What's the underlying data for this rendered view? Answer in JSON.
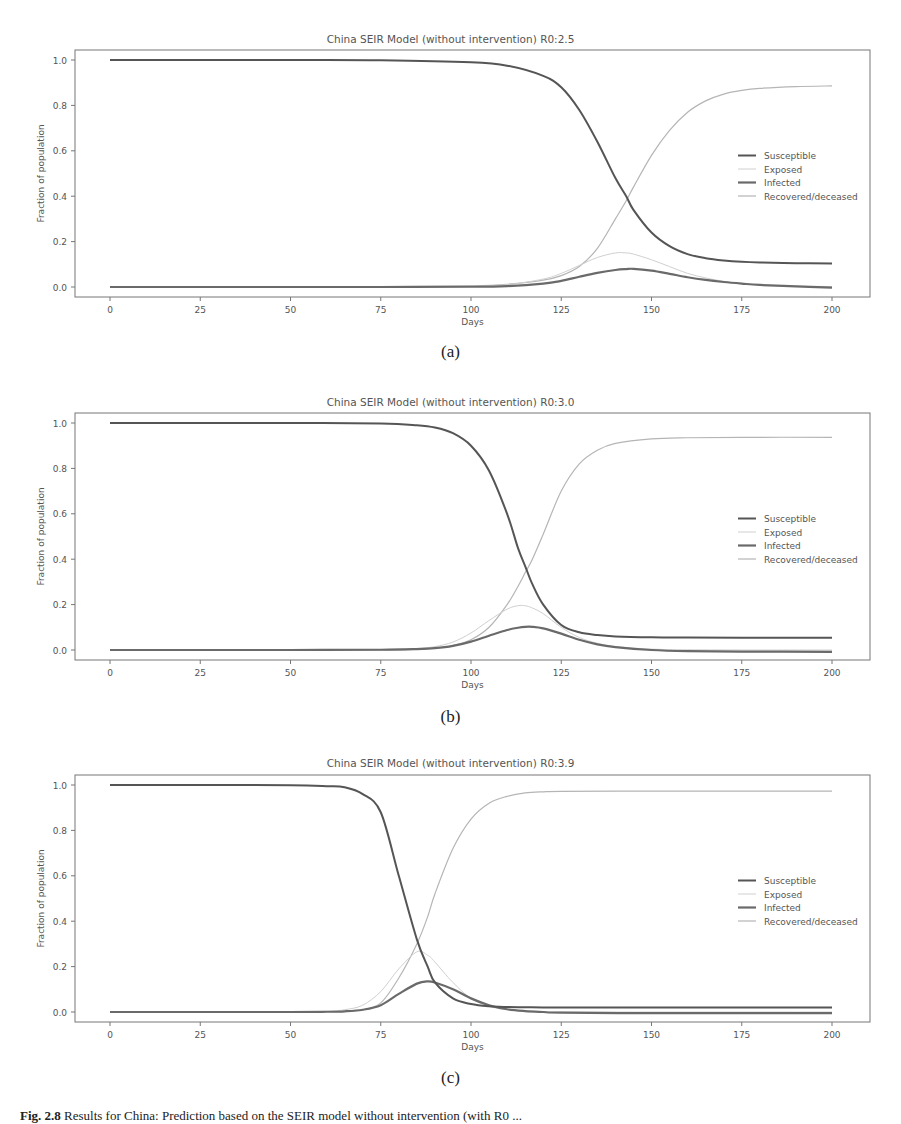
{
  "chart_data": [
    {
      "type": "line",
      "panel": "(a)",
      "title": "China SEIR Model (without intervention) R0:2.5",
      "xlabel": "Days",
      "ylabel": "Fraction of population",
      "xlim": [
        -8,
        208
      ],
      "ylim": [
        -0.05,
        1.05
      ],
      "xticks": [
        0,
        25,
        50,
        75,
        100,
        125,
        150,
        175,
        200
      ],
      "yticks": [
        0.0,
        0.2,
        0.4,
        0.6,
        0.8,
        1.0
      ],
      "grid": false,
      "legend_position": "center right",
      "x": [
        0,
        25,
        50,
        75,
        100,
        110,
        120,
        125,
        130,
        135,
        140,
        143,
        145,
        150,
        155,
        160,
        165,
        170,
        175,
        180,
        190,
        200
      ],
      "series": [
        {
          "name": "Susceptible",
          "color": "#555555",
          "values": [
            1.0,
            1.0,
            1.0,
            0.999,
            0.99,
            0.975,
            0.93,
            0.88,
            0.78,
            0.64,
            0.48,
            0.4,
            0.34,
            0.24,
            0.18,
            0.145,
            0.127,
            0.117,
            0.111,
            0.108,
            0.105,
            0.104
          ]
        },
        {
          "name": "Exposed",
          "color": "#d0d0d0",
          "values": [
            0.0,
            0.0,
            0.0,
            0.0,
            0.003,
            0.01,
            0.035,
            0.06,
            0.095,
            0.13,
            0.15,
            0.15,
            0.145,
            0.12,
            0.09,
            0.06,
            0.04,
            0.025,
            0.015,
            0.009,
            0.004,
            0.002
          ]
        },
        {
          "name": "Infected",
          "color": "#6a6a6a",
          "values": [
            0.0,
            0.0,
            0.0,
            0.0,
            0.001,
            0.004,
            0.015,
            0.027,
            0.045,
            0.062,
            0.075,
            0.079,
            0.08,
            0.072,
            0.058,
            0.043,
            0.031,
            0.022,
            0.015,
            0.009,
            0.003,
            -0.003
          ]
        },
        {
          "name": "Recovered/deceased",
          "color": "#b5b5b5",
          "values": [
            0.0,
            0.0,
            0.0,
            0.0,
            0.005,
            0.012,
            0.03,
            0.05,
            0.09,
            0.17,
            0.3,
            0.38,
            0.44,
            0.58,
            0.69,
            0.77,
            0.82,
            0.85,
            0.866,
            0.875,
            0.883,
            0.886
          ]
        }
      ]
    },
    {
      "type": "line",
      "panel": "(b)",
      "title": "China SEIR Model (without intervention) R0:3.0",
      "xlabel": "Days",
      "ylabel": "Fraction of population",
      "xlim": [
        -8,
        208
      ],
      "ylim": [
        -0.05,
        1.05
      ],
      "xticks": [
        0,
        25,
        50,
        75,
        100,
        125,
        150,
        175,
        200
      ],
      "yticks": [
        0.0,
        0.2,
        0.4,
        0.6,
        0.8,
        1.0
      ],
      "grid": false,
      "legend_position": "center right",
      "x": [
        0,
        25,
        50,
        75,
        85,
        90,
        95,
        100,
        105,
        110,
        113,
        115,
        117,
        120,
        125,
        130,
        135,
        140,
        150,
        160,
        175,
        200
      ],
      "series": [
        {
          "name": "Susceptible",
          "color": "#555555",
          "values": [
            1.0,
            1.0,
            1.0,
            0.998,
            0.99,
            0.98,
            0.955,
            0.9,
            0.79,
            0.6,
            0.45,
            0.37,
            0.29,
            0.2,
            0.11,
            0.078,
            0.066,
            0.06,
            0.056,
            0.055,
            0.054,
            0.054
          ]
        },
        {
          "name": "Exposed",
          "color": "#d0d0d0",
          "values": [
            0.0,
            0.0,
            0.0,
            0.002,
            0.007,
            0.015,
            0.035,
            0.075,
            0.13,
            0.18,
            0.195,
            0.195,
            0.185,
            0.16,
            0.1,
            0.055,
            0.03,
            0.015,
            0.004,
            0.001,
            0.0,
            0.0
          ]
        },
        {
          "name": "Infected",
          "color": "#6a6a6a",
          "values": [
            0.0,
            0.0,
            0.0,
            0.001,
            0.004,
            0.008,
            0.018,
            0.037,
            0.063,
            0.088,
            0.098,
            0.102,
            0.102,
            0.095,
            0.072,
            0.045,
            0.025,
            0.013,
            0.0,
            -0.005,
            -0.007,
            -0.008
          ]
        },
        {
          "name": "Recovered/deceased",
          "color": "#b5b5b5",
          "values": [
            0.0,
            0.0,
            0.0,
            0.0,
            0.003,
            0.008,
            0.02,
            0.045,
            0.1,
            0.2,
            0.28,
            0.34,
            0.4,
            0.51,
            0.7,
            0.82,
            0.88,
            0.91,
            0.93,
            0.935,
            0.937,
            0.937
          ]
        }
      ]
    },
    {
      "type": "line",
      "panel": "(c)",
      "title": "China SEIR Model (without intervention) R0:3.9",
      "xlabel": "Days",
      "ylabel": "Fraction of population",
      "xlim": [
        -8,
        208
      ],
      "ylim": [
        -0.05,
        1.05
      ],
      "xticks": [
        0,
        25,
        50,
        75,
        100,
        125,
        150,
        175,
        200
      ],
      "yticks": [
        0.0,
        0.2,
        0.4,
        0.6,
        0.8,
        1.0
      ],
      "grid": false,
      "legend_position": "center right",
      "x": [
        0,
        25,
        50,
        60,
        65,
        70,
        75,
        80,
        85,
        88,
        90,
        95,
        100,
        105,
        110,
        115,
        120,
        125,
        150,
        175,
        200
      ],
      "series": [
        {
          "name": "Susceptible",
          "color": "#555555",
          "values": [
            1.0,
            1.0,
            0.999,
            0.995,
            0.99,
            0.96,
            0.88,
            0.6,
            0.32,
            0.2,
            0.13,
            0.06,
            0.035,
            0.025,
            0.022,
            0.021,
            0.02,
            0.02,
            0.02,
            0.02,
            0.02
          ]
        },
        {
          "name": "Exposed",
          "color": "#d0d0d0",
          "values": [
            0.0,
            0.0,
            0.0,
            0.003,
            0.01,
            0.03,
            0.09,
            0.19,
            0.265,
            0.25,
            0.22,
            0.13,
            0.06,
            0.025,
            0.01,
            0.004,
            0.001,
            0.0,
            0.0,
            0.0,
            0.0
          ]
        },
        {
          "name": "Infected",
          "color": "#6a6a6a",
          "values": [
            0.0,
            0.0,
            0.0,
            0.001,
            0.003,
            0.01,
            0.03,
            0.08,
            0.125,
            0.135,
            0.13,
            0.1,
            0.06,
            0.03,
            0.012,
            0.004,
            0.0,
            -0.003,
            -0.005,
            -0.005,
            -0.005
          ]
        },
        {
          "name": "Recovered/deceased",
          "color": "#b5b5b5",
          "values": [
            0.0,
            0.0,
            0.0,
            0.001,
            0.003,
            0.01,
            0.04,
            0.15,
            0.3,
            0.42,
            0.52,
            0.72,
            0.85,
            0.92,
            0.95,
            0.965,
            0.97,
            0.972,
            0.973,
            0.973,
            0.973
          ]
        }
      ]
    }
  ],
  "panels": [
    {
      "title": "China SEIR Model (without intervention) R0:2.5",
      "label": "(a)"
    },
    {
      "title": "China SEIR Model (without intervention) R0:3.0",
      "label": "(b)"
    },
    {
      "title": "China SEIR Model (without intervention) R0:3.9",
      "label": "(c)"
    }
  ],
  "axes": {
    "xlabel": "Days",
    "ylabel": "Fraction of population",
    "xtick_labels": [
      "0",
      "25",
      "50",
      "75",
      "100",
      "125",
      "150",
      "175",
      "200"
    ],
    "ytick_labels": [
      "0.0",
      "0.2",
      "0.4",
      "0.6",
      "0.8",
      "1.0"
    ]
  },
  "legend": [
    "Susceptible",
    "Exposed",
    "Infected",
    "Recovered/deceased"
  ],
  "caption": {
    "label": "Fig. 2.8",
    "text": "Results for China: Prediction based on the SEIR model without intervention (with R0 ..."
  }
}
